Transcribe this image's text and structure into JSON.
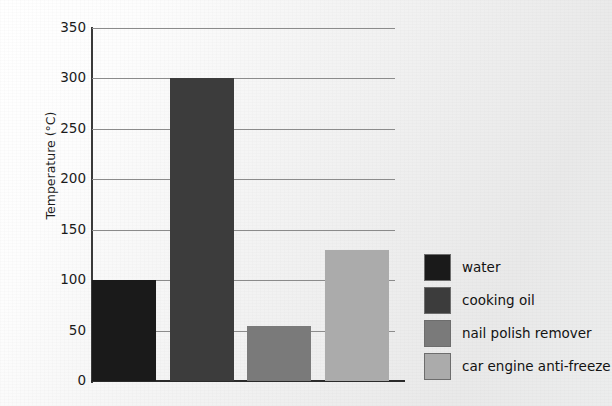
{
  "chart_data": {
    "type": "bar",
    "title": "",
    "subtitle": "",
    "xlabel": "",
    "ylabel": "Temperature (°C)",
    "categories": [
      "water",
      "cooking oil",
      "nail polish remover",
      "car engine anti-freeze"
    ],
    "values": [
      100,
      300,
      55,
      130
    ],
    "series": [
      {
        "name": "Boiling point",
        "values": [
          100,
          300,
          55,
          130
        ]
      }
    ],
    "ylim": [
      0,
      350
    ],
    "y_ticks": [
      0,
      50,
      100,
      150,
      200,
      250,
      300,
      350
    ],
    "y_tick_labels": [
      "0",
      "50",
      "100",
      "150",
      "200",
      "250",
      "300",
      "350"
    ],
    "x_tick_labels": [],
    "grid": true,
    "grid_axis": "y",
    "legend_position": "right",
    "legend": [
      {
        "label": "water",
        "color": "#1a1a1a",
        "value": 100
      },
      {
        "label": "cooking oil",
        "color": "#3c3c3c",
        "value": 300
      },
      {
        "label": "nail polish remover",
        "color": "#7a7a7a",
        "value": 55
      },
      {
        "label": "car engine anti-freeze",
        "color": "#ababab",
        "value": 130
      }
    ],
    "annotations": []
  },
  "colors": {
    "background": "#ededed",
    "axis": "#2b2b2b",
    "gridline": "#8b8b8b",
    "text": "#1b1b1b",
    "bar_water": "#1a1a1a",
    "bar_cooking_oil": "#3c3c3c",
    "bar_nail_polish_remover": "#7a7a7a",
    "bar_car_engine_anti_freeze": "#ababab"
  }
}
